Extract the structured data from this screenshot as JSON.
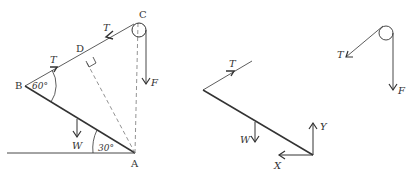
{
  "diagram": {
    "left": {
      "points": {
        "A": "A",
        "B": "B",
        "C": "C",
        "D": "D"
      },
      "angles": {
        "at_B": "60°",
        "at_A": "30°"
      },
      "forces": {
        "tension_upper": "T",
        "tension_lower": "T",
        "weight": "W",
        "applied": "F"
      }
    },
    "middle": {
      "forces": {
        "tension": "T",
        "weight": "W",
        "reaction_y": "Y",
        "reaction_x": "X"
      }
    },
    "right": {
      "forces": {
        "tension": "T",
        "applied": "F"
      }
    }
  },
  "colors": {
    "line": "#333333",
    "dashed": "#888888"
  }
}
